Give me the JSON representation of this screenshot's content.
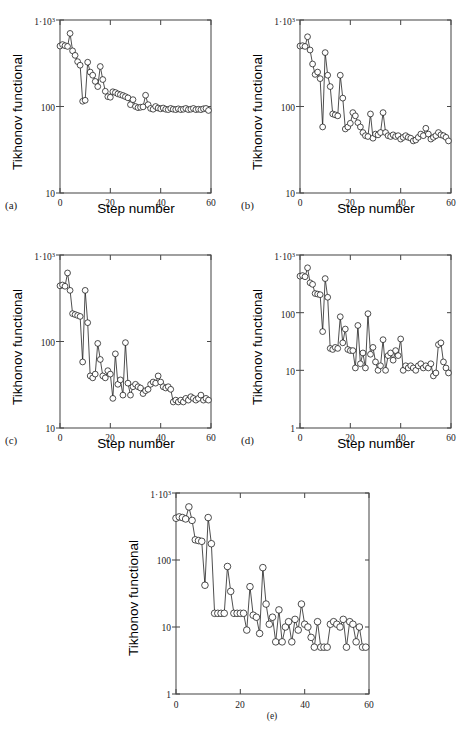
{
  "figure": {
    "panels": [
      {
        "tag": "(a)",
        "ylabel": "Tikhonov functional",
        "xlabel": "Step number",
        "ytick_labels": [
          "10",
          "100",
          "1·10³"
        ],
        "xtick_labels": [
          "0",
          "20",
          "40",
          "60"
        ]
      },
      {
        "tag": "(b)",
        "ylabel": "Tikhonov functional",
        "xlabel": "Step number",
        "ytick_labels": [
          "10",
          "100",
          "1·10³"
        ],
        "xtick_labels": [
          "0",
          "20",
          "40",
          "60"
        ]
      },
      {
        "tag": "(c)",
        "ylabel": "Tikhonov functional",
        "xlabel": "Step number",
        "ytick_labels": [
          "10",
          "100",
          "1·10³"
        ],
        "xtick_labels": [
          "0",
          "20",
          "40",
          "60"
        ]
      },
      {
        "tag": "(d)",
        "ylabel": "Tikhonov functional",
        "xlabel": "Step number",
        "ytick_labels": [
          "1",
          "10",
          "100",
          "1·10³"
        ],
        "xtick_labels": [
          "0",
          "20",
          "40",
          "60"
        ]
      },
      {
        "tag": "(e)",
        "ylabel": "Tikhonov functional",
        "xlabel": "",
        "ytick_labels": [
          "1",
          "10",
          "100",
          "1·10³"
        ],
        "xtick_labels": [
          "0",
          "20",
          "40",
          "60"
        ]
      }
    ]
  },
  "chart_data": [
    {
      "type": "line",
      "panel": "a",
      "title": "",
      "xlabel": "Step number",
      "ylabel": "Tikhonov functional",
      "yscale": "log",
      "xlim": [
        0,
        60
      ],
      "ylim": [
        10,
        1000
      ],
      "yticks": [
        10,
        100,
        1000
      ],
      "ytick_labels": [
        "10",
        "100",
        "1·10³"
      ],
      "xticks": [
        0,
        20,
        40,
        60
      ],
      "grid": false,
      "legend": null,
      "marker": "circle-open",
      "x": [
        0,
        1,
        2,
        3,
        4,
        5,
        6,
        7,
        8,
        9,
        10,
        11,
        12,
        13,
        14,
        15,
        16,
        17,
        18,
        19,
        20,
        21,
        22,
        23,
        24,
        25,
        26,
        27,
        28,
        29,
        30,
        31,
        32,
        33,
        34,
        35,
        36,
        37,
        38,
        39,
        40,
        41,
        42,
        43,
        44,
        45,
        46,
        47,
        48,
        49,
        50,
        51,
        52,
        53,
        54,
        55,
        56,
        57,
        58,
        59
      ],
      "values": [
        500,
        520,
        505,
        495,
        700,
        440,
        390,
        330,
        300,
        115,
        118,
        325,
        250,
        230,
        195,
        170,
        290,
        205,
        150,
        130,
        128,
        148,
        145,
        140,
        137,
        134,
        130,
        126,
        105,
        120,
        100,
        97,
        98,
        99,
        135,
        105,
        95,
        93,
        100,
        96,
        94,
        96,
        93,
        92,
        95,
        93,
        92,
        94,
        92,
        93,
        95,
        92,
        93,
        95,
        92,
        93,
        92,
        94,
        95,
        90
      ]
    },
    {
      "type": "line",
      "panel": "b",
      "title": "",
      "xlabel": "Step number",
      "ylabel": "Tikhonov functional",
      "yscale": "log",
      "xlim": [
        0,
        60
      ],
      "ylim": [
        10,
        1000
      ],
      "yticks": [
        10,
        100,
        1000
      ],
      "ytick_labels": [
        "10",
        "100",
        "1·10³"
      ],
      "xticks": [
        0,
        20,
        40,
        60
      ],
      "grid": false,
      "legend": null,
      "marker": "circle-open",
      "x": [
        0,
        1,
        2,
        3,
        4,
        5,
        6,
        7,
        8,
        9,
        10,
        11,
        12,
        13,
        14,
        15,
        16,
        17,
        18,
        19,
        20,
        21,
        22,
        23,
        24,
        25,
        26,
        27,
        28,
        29,
        30,
        31,
        32,
        33,
        34,
        35,
        36,
        37,
        38,
        39,
        40,
        41,
        42,
        43,
        44,
        45,
        46,
        47,
        48,
        49,
        50,
        51,
        52,
        53,
        54,
        55,
        56,
        57,
        58,
        59
      ],
      "values": [
        500,
        505,
        495,
        640,
        450,
        310,
        235,
        250,
        210,
        58,
        420,
        230,
        170,
        82,
        80,
        78,
        230,
        125,
        55,
        58,
        64,
        85,
        78,
        65,
        58,
        50,
        46,
        45,
        82,
        43,
        48,
        47,
        50,
        85,
        50,
        46,
        45,
        47,
        45,
        46,
        42,
        44,
        46,
        44,
        43,
        40,
        41,
        44,
        48,
        46,
        56,
        48,
        42,
        44,
        46,
        50,
        47,
        46,
        44,
        40
      ]
    },
    {
      "type": "line",
      "panel": "c",
      "title": "",
      "xlabel": "Step number",
      "ylabel": "Tikhonov functional",
      "yscale": "log",
      "xlim": [
        0,
        60
      ],
      "ylim": [
        10,
        1000
      ],
      "yticks": [
        10,
        100,
        1000
      ],
      "ytick_labels": [
        "10",
        "100",
        "1·10³"
      ],
      "xticks": [
        0,
        20,
        40,
        60
      ],
      "grid": false,
      "legend": null,
      "marker": "circle-open",
      "x": [
        0,
        1,
        2,
        3,
        4,
        5,
        6,
        7,
        8,
        9,
        10,
        11,
        12,
        13,
        14,
        15,
        16,
        17,
        18,
        19,
        20,
        21,
        22,
        23,
        24,
        25,
        26,
        27,
        28,
        29,
        30,
        31,
        32,
        33,
        34,
        35,
        36,
        37,
        38,
        39,
        40,
        41,
        42,
        43,
        44,
        45,
        46,
        47,
        48,
        49,
        50,
        51,
        52,
        53,
        54,
        55,
        56,
        57,
        58,
        59
      ],
      "values": [
        440,
        450,
        435,
        620,
        390,
        210,
        205,
        200,
        195,
        58,
        390,
        165,
        40,
        38,
        42,
        95,
        62,
        40,
        38,
        46,
        42,
        22,
        72,
        32,
        36,
        24,
        97,
        33,
        24,
        30,
        32,
        30,
        29,
        25,
        27,
        28,
        32,
        34,
        33,
        40,
        34,
        30,
        29,
        30,
        28,
        20,
        21,
        20,
        21,
        20,
        22,
        21,
        23,
        22,
        21,
        22,
        24,
        21,
        22,
        21
      ]
    },
    {
      "type": "line",
      "panel": "d",
      "title": "",
      "xlabel": "Step number",
      "ylabel": "Tikhonov functional",
      "yscale": "log",
      "xlim": [
        0,
        60
      ],
      "ylim": [
        1,
        1000
      ],
      "yticks": [
        1,
        10,
        100,
        1000
      ],
      "ytick_labels": [
        "1",
        "10",
        "100",
        "1·10³"
      ],
      "xticks": [
        0,
        20,
        40,
        60
      ],
      "grid": false,
      "legend": null,
      "marker": "circle-open",
      "x": [
        0,
        1,
        2,
        3,
        4,
        5,
        6,
        7,
        8,
        9,
        10,
        11,
        12,
        13,
        14,
        15,
        16,
        17,
        18,
        19,
        20,
        21,
        22,
        23,
        24,
        25,
        26,
        27,
        28,
        29,
        30,
        31,
        32,
        33,
        34,
        35,
        36,
        37,
        38,
        39,
        40,
        41,
        42,
        43,
        44,
        45,
        46,
        47,
        48,
        49,
        50,
        51,
        52,
        53,
        54,
        55,
        56,
        57,
        58,
        59
      ],
      "values": [
        430,
        440,
        420,
        600,
        330,
        310,
        215,
        210,
        205,
        47,
        390,
        185,
        24,
        23,
        25,
        24,
        85,
        30,
        52,
        23,
        22,
        22,
        11,
        60,
        13,
        20,
        11,
        96,
        19,
        25,
        14,
        10,
        12,
        34,
        10,
        18,
        20,
        15,
        22,
        18,
        35,
        10,
        12,
        11,
        12,
        11,
        10,
        12,
        13,
        11,
        12,
        11,
        13,
        8,
        9,
        28,
        30,
        14,
        11,
        9
      ]
    },
    {
      "type": "line",
      "panel": "e",
      "title": "",
      "xlabel": "",
      "ylabel": "Tikhonov functional",
      "yscale": "log",
      "xlim": [
        0,
        60
      ],
      "ylim": [
        1,
        1000
      ],
      "yticks": [
        1,
        10,
        100,
        1000
      ],
      "ytick_labels": [
        "1",
        "10",
        "100",
        "1·10³"
      ],
      "xticks": [
        0,
        20,
        40,
        60
      ],
      "grid": false,
      "legend": null,
      "marker": "circle-open",
      "x": [
        0,
        1,
        2,
        3,
        4,
        5,
        6,
        7,
        8,
        9,
        10,
        11,
        12,
        13,
        14,
        15,
        16,
        17,
        18,
        19,
        20,
        21,
        22,
        23,
        24,
        25,
        26,
        27,
        28,
        29,
        30,
        31,
        32,
        33,
        34,
        35,
        36,
        37,
        38,
        39,
        40,
        41,
        42,
        43,
        44,
        45,
        46,
        47,
        48,
        49,
        50,
        51,
        52,
        53,
        54,
        55,
        56,
        57,
        58,
        59
      ],
      "values": [
        420,
        440,
        430,
        410,
        620,
        390,
        200,
        195,
        190,
        42,
        430,
        175,
        16,
        16,
        16,
        16,
        80,
        34,
        16,
        16,
        16,
        16,
        9,
        40,
        15,
        14,
        8,
        77,
        22,
        11,
        14,
        6,
        18,
        6,
        10,
        12,
        6,
        13,
        9,
        22,
        11,
        10,
        7,
        5,
        12,
        5,
        5,
        5,
        11,
        12,
        11,
        10,
        13,
        5,
        12,
        11,
        6,
        10,
        5,
        5
      ]
    }
  ]
}
